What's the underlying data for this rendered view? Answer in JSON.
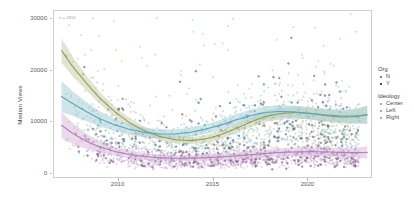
{
  "chart_data": {
    "type": "scatter",
    "title": "",
    "subtitle": "",
    "xlabel": "",
    "ylabel": "Median Views",
    "annotation": "n = 2851",
    "xlim": [
      2006.6,
      2023.4
    ],
    "ylim": [
      -900,
      31500
    ],
    "xticks": [
      2010,
      2015,
      2020
    ],
    "xticklabels": [
      "2010",
      "2015",
      "2020"
    ],
    "yticks": [
      0,
      10000,
      20000,
      30000
    ],
    "yticklabels": [
      "0",
      "10000",
      "20000",
      "30000"
    ],
    "grid": false,
    "legend_position": "right",
    "legends": [
      {
        "title": "Org",
        "type": "shape-alpha",
        "entries": [
          {
            "label": "N",
            "color": "#5a5a5a",
            "marker": "circle"
          },
          {
            "label": "Y",
            "color": "#111111",
            "marker": "circle"
          }
        ]
      },
      {
        "title": "Ideology",
        "type": "color",
        "entries": [
          {
            "label": "Center",
            "color": "#8f9a5c",
            "marker": "circle"
          },
          {
            "label": "Left",
            "color": "#59a3b5",
            "marker": "circle"
          },
          {
            "label": "Right",
            "color": "#b07bb8",
            "marker": "circle"
          }
        ]
      }
    ],
    "series": [
      {
        "name": "Center",
        "color": "#8f9a5c",
        "band_color": "#c9cfa8",
        "trend": [
          [
            2007.0,
            23800
          ],
          [
            2007.6,
            20600
          ],
          [
            2008.3,
            17500
          ],
          [
            2009.0,
            14600
          ],
          [
            2009.8,
            11900
          ],
          [
            2010.6,
            9700
          ],
          [
            2011.4,
            8100
          ],
          [
            2012.2,
            7000
          ],
          [
            2013.0,
            6400
          ],
          [
            2013.8,
            6200
          ],
          [
            2014.6,
            6500
          ],
          [
            2015.4,
            7300
          ],
          [
            2016.2,
            8500
          ],
          [
            2017.0,
            9800
          ],
          [
            2017.8,
            10900
          ],
          [
            2018.6,
            11500
          ],
          [
            2019.4,
            11700
          ],
          [
            2020.2,
            11500
          ],
          [
            2021.0,
            11100
          ],
          [
            2021.8,
            10800
          ],
          [
            2022.6,
            10900
          ],
          [
            2023.2,
            11300
          ]
        ],
        "band_width": [
          2400,
          1900,
          1500,
          1200,
          1000,
          900,
          800,
          750,
          700,
          700,
          750,
          800,
          900,
          1000,
          1100,
          1150,
          1200,
          1200,
          1200,
          1250,
          1400,
          1700
        ]
      },
      {
        "name": "Left",
        "color": "#59a3b5",
        "band_color": "#a8cfd9",
        "trend": [
          [
            2007.0,
            14800
          ],
          [
            2007.6,
            13400
          ],
          [
            2008.3,
            11900
          ],
          [
            2009.0,
            10500
          ],
          [
            2009.8,
            9300
          ],
          [
            2010.6,
            8400
          ],
          [
            2011.4,
            7800
          ],
          [
            2012.2,
            7500
          ],
          [
            2013.0,
            7500
          ],
          [
            2013.8,
            7800
          ],
          [
            2014.6,
            8400
          ],
          [
            2015.4,
            9200
          ],
          [
            2016.2,
            10200
          ],
          [
            2017.0,
            11100
          ],
          [
            2017.8,
            11700
          ],
          [
            2018.6,
            11900
          ],
          [
            2019.4,
            11800
          ],
          [
            2020.2,
            11500
          ],
          [
            2021.0,
            11200
          ],
          [
            2021.8,
            11000
          ],
          [
            2022.6,
            11000
          ],
          [
            2023.2,
            11200
          ]
        ],
        "band_width": [
          3000,
          2400,
          1900,
          1500,
          1250,
          1050,
          950,
          900,
          880,
          900,
          950,
          1000,
          1080,
          1150,
          1200,
          1220,
          1220,
          1200,
          1200,
          1250,
          1450,
          1800
        ]
      },
      {
        "name": "Right",
        "color": "#b07bb8",
        "band_color": "#d8bcdd",
        "trend": [
          [
            2007.0,
            9200
          ],
          [
            2007.6,
            7600
          ],
          [
            2008.3,
            6100
          ],
          [
            2009.0,
            5000
          ],
          [
            2009.8,
            4100
          ],
          [
            2010.6,
            3500
          ],
          [
            2011.4,
            3100
          ],
          [
            2012.2,
            2850
          ],
          [
            2013.0,
            2750
          ],
          [
            2013.8,
            2750
          ],
          [
            2014.6,
            2850
          ],
          [
            2015.4,
            3000
          ],
          [
            2016.2,
            3200
          ],
          [
            2017.0,
            3450
          ],
          [
            2017.8,
            3700
          ],
          [
            2018.6,
            3900
          ],
          [
            2019.4,
            4000
          ],
          [
            2020.2,
            4050
          ],
          [
            2021.0,
            4000
          ],
          [
            2021.8,
            3900
          ],
          [
            2022.6,
            3850
          ],
          [
            2023.2,
            3900
          ]
        ],
        "band_width": [
          2600,
          2000,
          1500,
          1150,
          900,
          750,
          650,
          600,
          570,
          570,
          600,
          640,
          690,
          740,
          780,
          810,
          830,
          840,
          850,
          880,
          980,
          1200
        ]
      }
    ]
  }
}
